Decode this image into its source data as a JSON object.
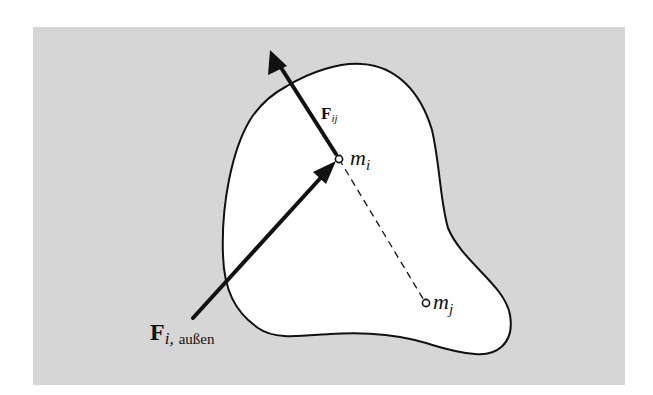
{
  "figure": {
    "background_color": "#d6d6d6",
    "body_fill": "#ffffff",
    "stroke_color": "#111111",
    "labels": {
      "internal_force": {
        "main": "F",
        "sub": "ij"
      },
      "mass_i": {
        "main": "m",
        "sub": "i"
      },
      "mass_j": {
        "main": "m",
        "sub": "j"
      },
      "external_force": {
        "main": "F",
        "sub": "i,",
        "suffix": "außen"
      }
    }
  }
}
